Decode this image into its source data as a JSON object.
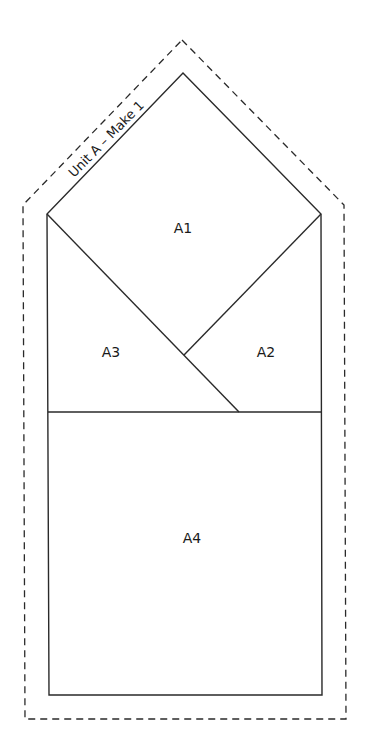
{
  "pattern": {
    "unit_label": "Unit A – Make 1",
    "colors": {
      "line": "#2a2a2a",
      "background": "#ffffff"
    },
    "pieces": [
      {
        "id": "A1",
        "label": "A1"
      },
      {
        "id": "A2",
        "label": "A2"
      },
      {
        "id": "A3",
        "label": "A3"
      },
      {
        "id": "A4",
        "label": "A4"
      }
    ]
  }
}
